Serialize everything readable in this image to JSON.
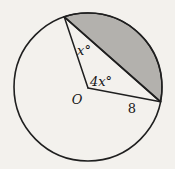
{
  "figure": {
    "kind": "circle-geometry-diagram",
    "labels": {
      "angle_top": "x°",
      "angle_center": "4x°",
      "center_point": "O",
      "radius_length": "8"
    },
    "colors": {
      "background": "#f3f1ed",
      "shaded_segment": "#b3b1ad",
      "line": "#1f1f1f"
    }
  }
}
